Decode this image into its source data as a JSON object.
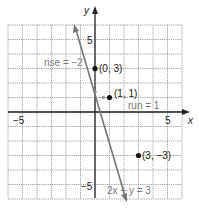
{
  "chart_data": {
    "type": "line",
    "title": "",
    "xlabel": "x",
    "ylabel": "y",
    "xlim": [
      -6,
      6
    ],
    "ylim": [
      -6,
      6
    ],
    "grid": true,
    "x_ticks_labeled": [
      -5,
      5
    ],
    "y_ticks_labeled": [
      5,
      -5
    ],
    "tick_labels": {
      "x_neg": "−5",
      "x_pos": "5",
      "y_pos": "5",
      "y_neg": "−5"
    },
    "series": [
      {
        "name": "2x + y = 3",
        "equation": "y = -2x + 3",
        "slope": -2,
        "intercept": 3
      }
    ],
    "points": [
      {
        "label": "(0, 3)",
        "x": 0,
        "y": 3
      },
      {
        "label": "(1, 1)",
        "x": 1,
        "y": 1
      },
      {
        "label": "(3, −3)",
        "x": 3,
        "y": -3
      }
    ],
    "annotations": [
      {
        "text": "rise = −2",
        "type": "rise"
      },
      {
        "text": "run = 1",
        "type": "run"
      },
      {
        "text": "2x + y = 3",
        "type": "line-label"
      }
    ]
  },
  "labels": {
    "x_axis": "x",
    "y_axis": "y",
    "x_neg5": "−5",
    "x_pos5": "5",
    "y_pos5": "5",
    "y_neg5": "−5",
    "p1": "(0, 3)",
    "p2": "(1, 1)",
    "p3": "(3, −3)",
    "rise": "rise = −2",
    "run": "run = 1",
    "equation": "2x + y = 3"
  }
}
